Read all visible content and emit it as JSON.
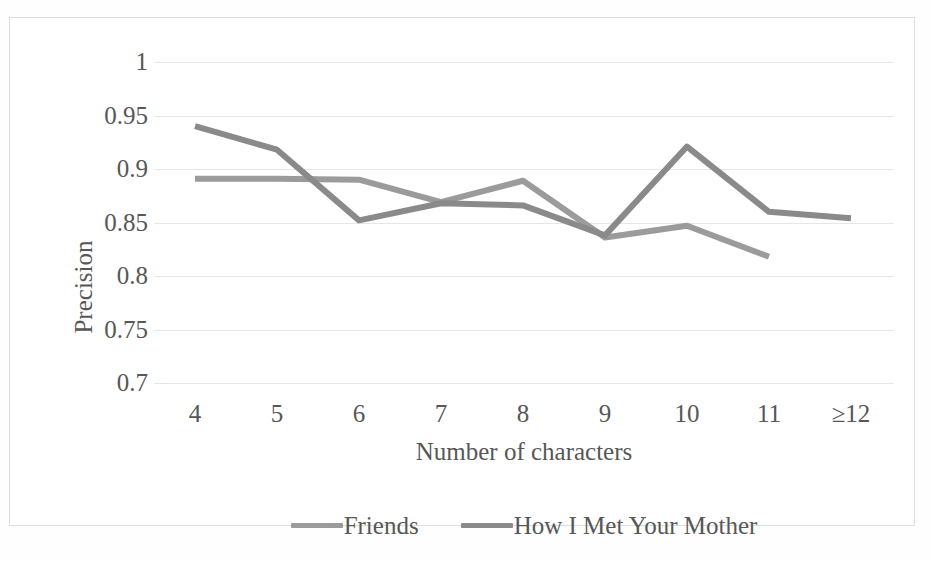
{
  "chart_data": {
    "type": "line",
    "title": "",
    "xlabel": "Number of characters",
    "ylabel": "Precision",
    "categories": [
      "4",
      "5",
      "6",
      "7",
      "8",
      "9",
      "10",
      "11",
      "≥12"
    ],
    "ylim": [
      0.7,
      1
    ],
    "yticks": [
      "1",
      "0.95",
      "0.9",
      "0.85",
      "0.8",
      "0.75",
      "0.7"
    ],
    "ytick_values": [
      1,
      0.95,
      0.9,
      0.85,
      0.8,
      0.75,
      0.7
    ],
    "grid": "horizontal",
    "legend_position": "bottom",
    "series": [
      {
        "name": "Friends",
        "color": "#9b9b9b",
        "values": [
          0.891,
          0.891,
          0.89,
          0.869,
          0.889,
          0.836,
          0.847,
          0.818,
          null
        ]
      },
      {
        "name": "How I Met Your Mother",
        "color": "#8a8a8a",
        "values": [
          0.94,
          0.918,
          0.852,
          0.868,
          0.866,
          0.838,
          0.921,
          0.86,
          0.854
        ]
      }
    ]
  },
  "legend": {
    "entries": [
      {
        "label": "Friends",
        "swatch": "line-swatch-friends"
      },
      {
        "label": "How I Met Your Mother",
        "swatch": "line-swatch-himym"
      }
    ]
  },
  "axes": {
    "y_title": "Precision",
    "x_title": "Number of characters"
  },
  "colors": {
    "series_friends": "#9b9b9b",
    "series_himym": "#8a8a8a",
    "gridline": "#e6e6e6",
    "frame": "#dedede",
    "text": "#575757",
    "background": "#ffffff"
  }
}
